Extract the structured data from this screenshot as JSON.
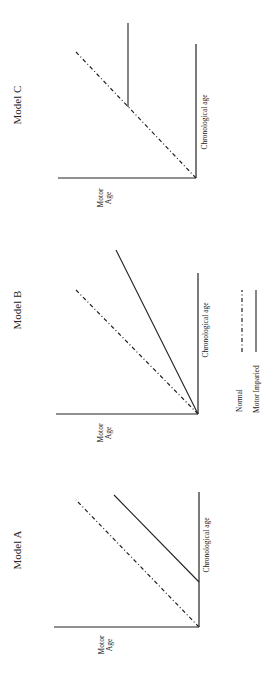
{
  "figure": {
    "orientation": "rotated 90 degrees counter-clockwise",
    "panels": [
      {
        "id": "C",
        "title": "Model C",
        "y_axis_label_line1": "Motor",
        "y_axis_label_line2": "Age",
        "x_axis_label": "Chronological age",
        "description": "Normal: dash-dot line rising from origin; Motor impaired: follows normal line then plateaus (flat) at a constant motor age"
      },
      {
        "id": "B",
        "title": "Model B",
        "y_axis_label_line1": "Motor",
        "y_axis_label_line2": "Age",
        "x_axis_label": "Chronological age",
        "description": "Both lines start at origin; motor impaired line has a lower slope than normal"
      },
      {
        "id": "A",
        "title": "Model A",
        "y_axis_label_line1": "Motor",
        "y_axis_label_line2": "Age",
        "x_axis_label": "Chronological age",
        "description": "Motor impaired line parallel to normal line but delayed (offset along chronological age)"
      }
    ],
    "legend": {
      "items": [
        {
          "label": "Normal",
          "style": "dash-dot"
        },
        {
          "label": "Motor Imparied",
          "style": "solid"
        }
      ]
    }
  }
}
